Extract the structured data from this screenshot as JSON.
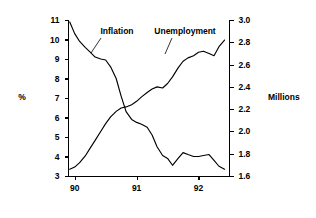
{
  "chart_data": {
    "type": "line",
    "title": "",
    "subtitle": "",
    "xlabel": "",
    "ylabel": "%",
    "y2label": "Millions",
    "grid": false,
    "legend_position": "inline-annotations",
    "xlim": [
      89.9,
      92.5
    ],
    "xticks": [
      "90",
      "91",
      "92"
    ],
    "xtick_values": [
      90,
      91,
      92
    ],
    "ylim": [
      3,
      11
    ],
    "yticks": [
      "3",
      "4",
      "5",
      "6",
      "7",
      "8",
      "9",
      "10",
      "11"
    ],
    "ytick_values": [
      3,
      4,
      5,
      6,
      7,
      8,
      9,
      10,
      11
    ],
    "y2lim": [
      1.6,
      3.0
    ],
    "y2ticks": [
      "1.6",
      "1.8",
      "2.0",
      "2.2",
      "2.4",
      "2.6",
      "2.8",
      "3.0"
    ],
    "y2tick_values": [
      1.6,
      1.8,
      2.0,
      2.2,
      2.4,
      2.6,
      2.8,
      3.0
    ],
    "series": [
      {
        "name": "Inflation",
        "axis": "left",
        "unit": "%",
        "label_text": "Inflation",
        "x": [
          89.92,
          90.0,
          90.08,
          90.17,
          90.25,
          90.33,
          90.42,
          90.5,
          90.58,
          90.67,
          90.75,
          90.83,
          90.92,
          91.0,
          91.08,
          91.17,
          91.25,
          91.33,
          91.42,
          91.5,
          91.58,
          91.67,
          91.75,
          91.83,
          91.92,
          92.0,
          92.08,
          92.17,
          92.25,
          92.33,
          92.42
        ],
        "values": [
          10.9,
          10.3,
          9.9,
          9.6,
          9.35,
          9.1,
          9.0,
          8.95,
          8.6,
          8.0,
          7.1,
          6.3,
          5.9,
          5.75,
          5.65,
          5.5,
          5.1,
          4.5,
          4.05,
          3.9,
          3.55,
          3.9,
          4.2,
          4.1,
          4.0,
          4.0,
          4.05,
          4.1,
          3.8,
          3.5,
          3.35
        ]
      },
      {
        "name": "Unemployment",
        "axis": "right",
        "unit": "Millions",
        "label_text": "Unemployment",
        "x": [
          89.92,
          90.0,
          90.08,
          90.17,
          90.25,
          90.33,
          90.42,
          90.5,
          90.58,
          90.67,
          90.75,
          90.83,
          90.92,
          91.0,
          91.08,
          91.17,
          91.25,
          91.33,
          91.42,
          91.5,
          91.58,
          91.67,
          91.75,
          91.83,
          91.92,
          92.0,
          92.08,
          92.17,
          92.25,
          92.33,
          92.42
        ],
        "values": [
          1.66,
          1.68,
          1.72,
          1.78,
          1.85,
          1.92,
          2.0,
          2.07,
          2.13,
          2.18,
          2.21,
          2.22,
          2.24,
          2.27,
          2.31,
          2.35,
          2.38,
          2.4,
          2.39,
          2.43,
          2.49,
          2.57,
          2.63,
          2.66,
          2.68,
          2.71,
          2.72,
          2.7,
          2.68,
          2.76,
          2.82
        ]
      }
    ],
    "annotations": [
      {
        "text": "Inflation",
        "target_series": "Inflation"
      },
      {
        "text": "Unemployment",
        "target_series": "Unemployment"
      }
    ]
  }
}
